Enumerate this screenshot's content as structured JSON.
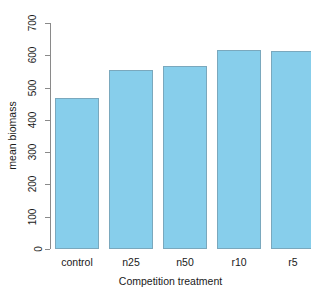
{
  "chart_data": {
    "type": "bar",
    "title": "",
    "xlabel": "Competition treatment",
    "ylabel": "mean biomass",
    "categories": [
      "control",
      "n25",
      "n50",
      "r10",
      "r5"
    ],
    "values": [
      468,
      555,
      568,
      615,
      612
    ],
    "ylim": [
      0,
      700
    ],
    "yticks": [
      0,
      100,
      200,
      300,
      400,
      500,
      600,
      700
    ],
    "ytick_labels": [
      "0",
      "100",
      "200",
      "300",
      "400",
      "500",
      "600",
      "700"
    ],
    "grid": false,
    "legend": null,
    "bar_color": "#87CEEB",
    "bar_border_color": "#7aa8bd",
    "axis_color": "#8a8a8a",
    "background": "#ffffff"
  }
}
